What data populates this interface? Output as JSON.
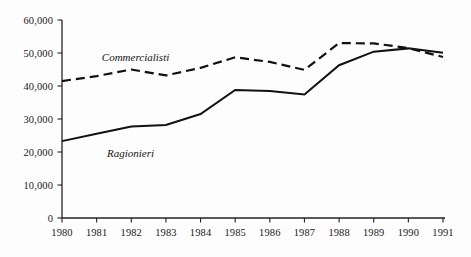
{
  "chart_data": {
    "type": "line",
    "title": "",
    "subtitle": "",
    "xlabel": "",
    "ylabel": "",
    "x": [
      1980,
      1981,
      1982,
      1983,
      1984,
      1985,
      1986,
      1987,
      1988,
      1989,
      1990,
      1991
    ],
    "categories": [
      "1980",
      "1981",
      "1982",
      "1983",
      "1984",
      "1985",
      "1986",
      "1987",
      "1988",
      "1989",
      "1990",
      "1991"
    ],
    "series": [
      {
        "name": "Commercialisti",
        "style": "dashed",
        "color": "#111111",
        "values": [
          41500,
          43000,
          45000,
          43200,
          45500,
          48700,
          47300,
          44900,
          53000,
          52900,
          51500,
          48800
        ]
      },
      {
        "name": "Ragionieri",
        "style": "solid",
        "color": "#111111",
        "values": [
          23300,
          25500,
          27700,
          28200,
          31500,
          38800,
          38500,
          37400,
          46300,
          50400,
          51400,
          50100
        ]
      }
    ],
    "ylim": [
      0,
      60000
    ],
    "xlim": [
      1980,
      1991
    ],
    "yticks": [
      0,
      10000,
      20000,
      30000,
      40000,
      50000,
      60000
    ],
    "ytick_labels": [
      "0",
      "10,000",
      "20,000",
      "30,000",
      "40,000",
      "50,000",
      "60,000"
    ],
    "xtick_labels": [
      "1980",
      "1981",
      "1982",
      "1983",
      "1984",
      "1985",
      "1986",
      "1987",
      "1988",
      "1989",
      "1990",
      "1991"
    ],
    "grid": false,
    "legend_position": "inline-annotations",
    "annotations": [
      {
        "text": "Commercialisti",
        "x": 1981.15,
        "y": 50600
      },
      {
        "text": "Ragionieri",
        "x": 1981.3,
        "y": 21600
      }
    ]
  },
  "axis": {
    "line_color": "#222222",
    "background": "#fdfdfd"
  }
}
